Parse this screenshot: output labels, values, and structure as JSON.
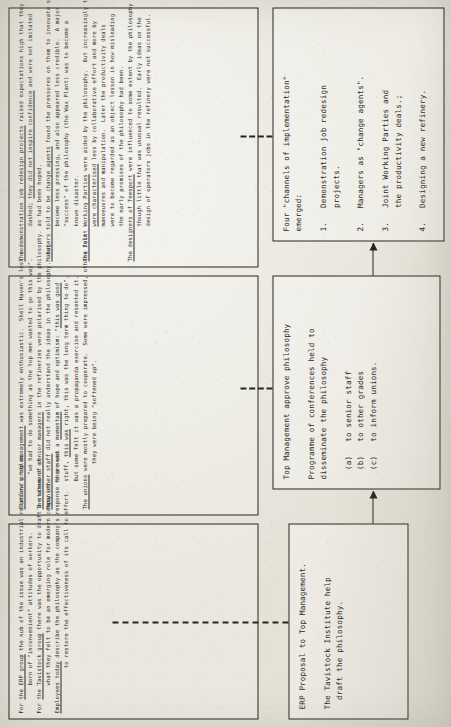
{
  "document": {
    "kind": "scanned-flowchart",
    "orientation": "rotated-90-ccw",
    "ink_color": "#26241f",
    "paper_color": "#eceae2"
  },
  "flow": {
    "boxes": [
      {
        "id": "flow-1",
        "name": "erp-proposal-box",
        "lines": [
          "ERP Proposal to Top Management.",
          "",
          "The Tavistock Institute help",
          "  draft the philosophy."
        ]
      },
      {
        "id": "flow-2",
        "name": "top-management-approve-box",
        "lines": [
          "Top Management approve philosophy",
          "",
          "Programme of conferences held to",
          "disseminate the philosophy",
          "",
          "  (a)   to senior staff",
          "  (b)   to other grades",
          "  (c)   to inform unions."
        ]
      },
      {
        "id": "flow-3",
        "name": "channels-of-implementation-box",
        "lines": [
          "Four \"channels of implementation\"",
          "emerged:",
          "",
          "1.   Demonstration job redesign",
          "     projects.",
          "",
          "2.   Managers as \"change agents\".",
          "",
          "3.   Joint Working Parties and",
          "     the productivity deals.;",
          "",
          "4.   Designing a new refinery."
        ]
      }
    ]
  },
  "notes": {
    "boxes": [
      {
        "id": "note-1",
        "name": "annotation-erp-proposal",
        "lines": [
          "For the ERP group the nub of the issue was an industrial relations problem",
          "        born of \"inconvenient\" attitudes of workers.",
          "For the Tavistock group there was the opportunity to draft a statement of",
          "        what they felt to be an emerging role for modern companies.",
          "Employees today describe the philosophy as the company's response to a need",
          "             to restore the effectiveness of its call to effort."
        ]
      },
      {
        "id": "note-2",
        "name": "annotation-top-management",
        "lines": [
          "Stanlow's top management was extremely enthusiastic.  Shell Haven's less so:",
          "          \"we had to do something as the top men wanted to go this way\".",
          "The views of senior managers in the refineries were polarised by the philosophy.",
          "Many other staff did not really understand the ideas in the philosophy.  But",
          "        there was a momentum of hope and optimism: \"this was good",
          "        stuff, this was right, this was the long term thing to do\".",
          "        But some felt it was a propaganda exercise and resented it.",
          "The unions were mostly prepared to cooperate.  Some were impressed, others felt",
          "             they were being \"softened up\"."
        ]
      },
      {
        "id": "note-3",
        "name": "annotation-channels-of-implementation",
        "lines": [
          "The demonstration job redesign projects raised expectations high that they then",
          "          dashed; they did not inspire confidence and were not imitated",
          "          as had been hoped.",
          "Managers told to be change agents found the pressures on them to innovate soon",
          "          become less pressing, and also appeared less credible.  A major",
          "          \"success\" of the philosophy (the Wax Plant) was to become a",
          "          known disaster.",
          "The Joint Working Parties were aided by the philosophy.  But increasingly these",
          "          were characterised less by collaborative effort and more by",
          "          manoeuvres and manipulation.  Later the productivity deals",
          "          were to become regarded as an object lesson in how misleading",
          "          the early promises of the philosophy had been.",
          "The designers of Teesport were influenced to some extent by the philosophy",
          "          though little that was unusual resulted.  Early ideas on the",
          "          design of operators jobs in the refinery were not successful."
        ]
      }
    ]
  }
}
